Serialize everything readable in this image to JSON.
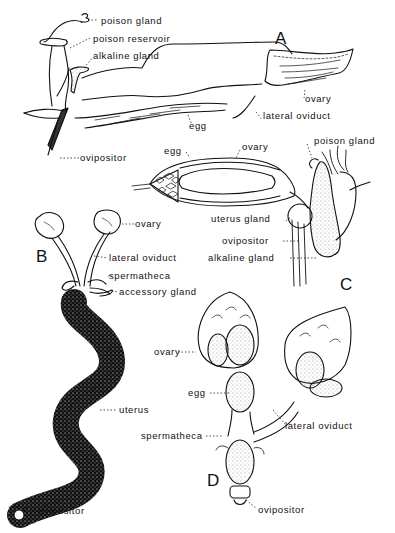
{
  "figure": {
    "panels": [
      {
        "id": "A",
        "letter": "A",
        "labels": [
          "poison gland",
          "poison reservoir",
          "alkaline gland",
          "ovary",
          "lateral oviduct",
          "egg",
          "ovipositor"
        ]
      },
      {
        "id": "B",
        "letter": "B",
        "labels": [
          "ovary",
          "lateral oviduct",
          "spermatheca",
          "accessory gland",
          "uterus",
          "ovipositor"
        ]
      },
      {
        "id": "C",
        "letter": "C",
        "labels": [
          "egg",
          "ovary",
          "poison gland",
          "uterus gland",
          "ovipositor",
          "alkaline gland"
        ]
      },
      {
        "id": "D",
        "letter": "D",
        "labels": [
          "ovary",
          "egg",
          "lateral oviduct",
          "spermatheca",
          "ovipositor"
        ]
      }
    ]
  },
  "A": {
    "letter": "A",
    "poison_gland": "poison gland",
    "poison_reservoir": "poison reservoir",
    "alkaline_gland": "alkaline gland",
    "ovary": "ovary",
    "lateral_oviduct": "lateral oviduct",
    "egg": "egg",
    "ovipositor": "ovipositor"
  },
  "B": {
    "letter": "B",
    "ovary": "ovary",
    "lateral_oviduct": "lateral oviduct",
    "spermatheca": "spermatheca",
    "accessory_gland": "accessory gland",
    "uterus": "uterus",
    "ovipositor": "ovipositor"
  },
  "C": {
    "letter": "C",
    "egg": "egg",
    "ovary": "ovary",
    "poison_gland": "poison gland",
    "uterus_gland": "uterus gland",
    "ovipositor": "ovipositor",
    "alkaline_gland": "alkaline gland"
  },
  "D": {
    "letter": "D",
    "ovary": "ovary",
    "egg": "egg",
    "lateral_oviduct": "lateral oviduct",
    "spermatheca": "spermatheca",
    "ovipositor": "ovipositor"
  }
}
